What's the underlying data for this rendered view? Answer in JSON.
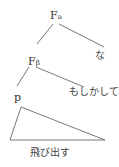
{
  "tree": {
    "root": {
      "label": "F",
      "subscript": "a"
    },
    "right_leaf_1": {
      "label": "な"
    },
    "mid": {
      "label": "F",
      "subscript": "β"
    },
    "right_leaf_2": {
      "label": "もしかして"
    },
    "p_node": {
      "label": "p"
    },
    "triangle_label": {
      "label": "飛び出す"
    }
  },
  "colors": {
    "line": "#555555",
    "text": "#333333",
    "background": "#ffffff"
  }
}
